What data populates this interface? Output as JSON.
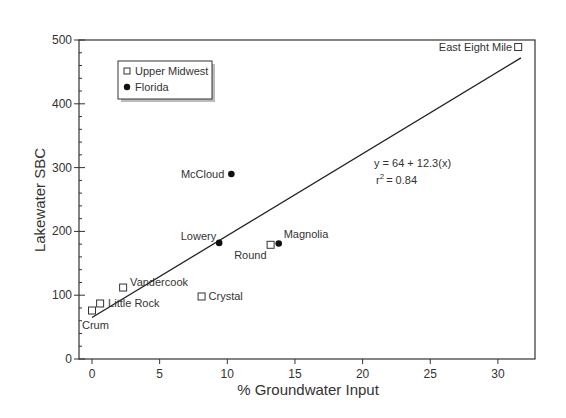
{
  "chart_data": {
    "type": "scatter",
    "title": "",
    "xlabel": "% Groundwater Input",
    "ylabel": "Lakewater SBC",
    "xlim": [
      -1,
      32.5
    ],
    "ylim": [
      0,
      500
    ],
    "xticks": [
      0,
      5,
      10,
      15,
      20,
      25,
      30
    ],
    "yticks": [
      0,
      100,
      200,
      300,
      400,
      500
    ],
    "y_minor_step": 20,
    "grid": false,
    "legend": {
      "position": "upper-left",
      "entries": [
        {
          "label": "Upper Midwest",
          "marker": "open-square"
        },
        {
          "label": "Florida",
          "marker": "filled-circle"
        }
      ]
    },
    "series": [
      {
        "name": "Upper Midwest",
        "marker": "open-square",
        "points": [
          {
            "label": "Crum",
            "x": 0.0,
            "y": 76
          },
          {
            "label": "Little Rock",
            "x": 0.6,
            "y": 87
          },
          {
            "label": "Vandercook",
            "x": 2.3,
            "y": 112
          },
          {
            "label": "Crystal",
            "x": 8.1,
            "y": 98
          },
          {
            "label": "Round",
            "x": 13.2,
            "y": 179
          },
          {
            "label": "East Eight Mile",
            "x": 31.5,
            "y": 489
          }
        ]
      },
      {
        "name": "Florida",
        "marker": "filled-circle",
        "points": [
          {
            "label": "McCloud",
            "x": 10.3,
            "y": 290
          },
          {
            "label": "Lowery",
            "x": 9.4,
            "y": 182
          },
          {
            "label": "Magnolia",
            "x": 13.8,
            "y": 181
          }
        ]
      }
    ],
    "regression": {
      "equation": "y = 64 + 12.3(x)",
      "r2_label": "r",
      "r2_sup": "2",
      "r2_value": "= 0.84",
      "intercept": 64,
      "slope": 12.3,
      "r2": 0.84,
      "line_from": {
        "x": 0,
        "y": 65
      },
      "line_to": {
        "x": 31.7,
        "y": 472
      }
    }
  }
}
